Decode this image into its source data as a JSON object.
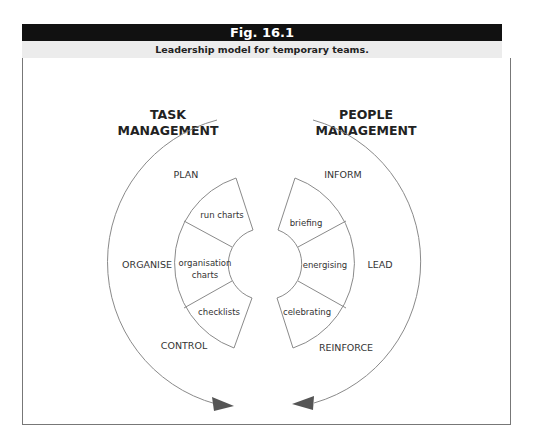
{
  "figure": {
    "number": "Fig. 16.1",
    "caption": "Leadership model for temporary teams."
  },
  "diagram": {
    "left": {
      "heading_line1": "TASK",
      "heading_line2": "MANAGEMENT",
      "outer_labels": [
        "PLAN",
        "ORGANISE",
        "CONTROL"
      ],
      "segments": [
        "run charts",
        "organisation",
        "charts",
        "checklists"
      ]
    },
    "right": {
      "heading_line1": "PEOPLE",
      "heading_line2": "MANAGEMENT",
      "outer_labels": [
        "INFORM",
        "LEAD",
        "REINFORCE"
      ],
      "segments": [
        "briefing",
        "energising",
        "celebrating"
      ]
    },
    "colors": {
      "header_bg": "#111111",
      "subtitle_bg": "#ececec",
      "line": "#888888",
      "arrow": "#555555"
    }
  }
}
